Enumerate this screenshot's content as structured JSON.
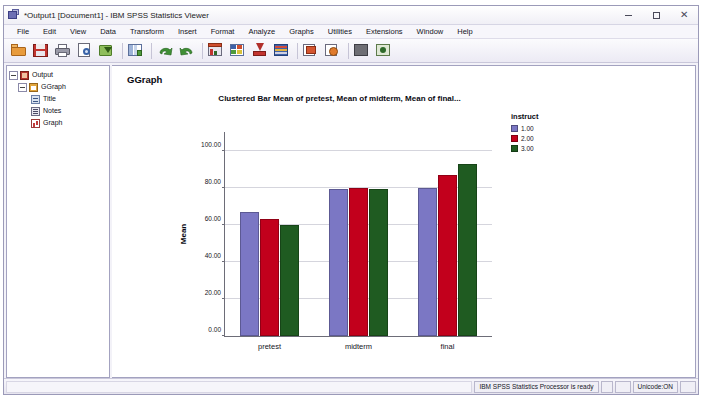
{
  "window": {
    "title": "*Output1 [Document1] - IBM SPSS Statistics Viewer",
    "app_icon": "spss-viewer-icon",
    "minimize_label": "Minimize",
    "maximize_label": "Maximize",
    "close_label": "Close"
  },
  "menubar": {
    "items": [
      {
        "label": "File"
      },
      {
        "label": "Edit"
      },
      {
        "label": "View"
      },
      {
        "label": "Data"
      },
      {
        "label": "Transform"
      },
      {
        "label": "Insert"
      },
      {
        "label": "Format"
      },
      {
        "label": "Analyze"
      },
      {
        "label": "Graphs"
      },
      {
        "label": "Utilities"
      },
      {
        "label": "Extensions"
      },
      {
        "label": "Window"
      },
      {
        "label": "Help"
      }
    ]
  },
  "toolbar": {
    "buttons": [
      {
        "name": "open-file-icon"
      },
      {
        "name": "save-icon"
      },
      {
        "name": "print-icon"
      },
      {
        "name": "print-preview-icon"
      },
      {
        "name": "export-icon"
      },
      {
        "name": "go-to-data-icon"
      },
      {
        "name": "undo-icon"
      },
      {
        "name": "redo-icon"
      },
      {
        "name": "go-to-case-icon"
      },
      {
        "name": "variables-icon"
      },
      {
        "name": "insert-new-icon"
      },
      {
        "name": "run-descriptives-icon"
      },
      {
        "name": "promote-icon"
      },
      {
        "name": "demote-icon"
      },
      {
        "name": "hide-icon"
      },
      {
        "name": "show-icon"
      }
    ]
  },
  "outline": {
    "nodes": [
      {
        "label": "Output",
        "icon": "output-icon",
        "indent": 0,
        "expander": "minus"
      },
      {
        "label": "GGraph",
        "icon": "ggraph-icon",
        "indent": 1,
        "expander": "minus"
      },
      {
        "label": "Title",
        "icon": "title-icon",
        "indent": 2,
        "expander": "none"
      },
      {
        "label": "Notes",
        "icon": "notes-icon",
        "indent": 2,
        "expander": "none"
      },
      {
        "label": "Graph",
        "icon": "graph-icon",
        "indent": 2,
        "expander": "none"
      }
    ]
  },
  "content": {
    "ggraph_heading": "GGraph"
  },
  "chart_data": {
    "type": "bar",
    "title": "Clustered Bar Mean of pretest, Mean of midterm, Mean of final...",
    "categories": [
      "pretest",
      "midterm",
      "final"
    ],
    "series": [
      {
        "name": "1.00",
        "color": "#7B77C4",
        "values": [
          67,
          79.5,
          80
        ]
      },
      {
        "name": "2.00",
        "color": "#C2001C",
        "values": [
          63,
          79.8,
          87
        ]
      },
      {
        "name": "3.00",
        "color": "#1F5B21",
        "values": [
          60,
          79.2,
          93
        ]
      }
    ],
    "xlabel": "",
    "ylabel": "Mean",
    "ylim": [
      0,
      110
    ],
    "yticks": [
      0,
      20,
      40,
      60,
      80,
      100
    ],
    "ytick_labels": [
      "0.00",
      "20.00",
      "40.00",
      "60.00",
      "80.00",
      "100.00"
    ],
    "grid": true,
    "legend_title": "instruct",
    "legend_position": "right"
  },
  "statusbar": {
    "processor_status": "IBM SPSS Statistics Processor is ready",
    "unicode_status": "Unicode:ON"
  }
}
